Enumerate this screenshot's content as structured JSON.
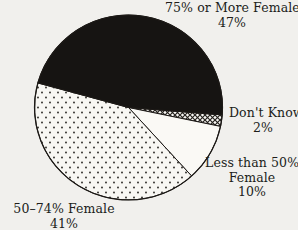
{
  "chart_data": {
    "type": "pie",
    "title": "",
    "unit": "%",
    "total": 100,
    "start_angle_deg": 4.6,
    "direction": "clockwise",
    "legend_position": "outside-labels",
    "slices": [
      {
        "id": "dont-know",
        "label": "Don't Know",
        "pct_label": "2%",
        "value": 2,
        "fill": "crosshatch"
      },
      {
        "id": "less-than-50-female",
        "label": "Less than 50% Female",
        "pct_label": "10%",
        "value": 10,
        "fill": "white"
      },
      {
        "id": "50-74-female",
        "label": "50–74% Female",
        "pct_label": "41%",
        "value": 41,
        "fill": "dots"
      },
      {
        "id": "75-or-more-female",
        "label": "75% or More Female",
        "pct_label": "47%",
        "value": 47,
        "fill": "black"
      }
    ],
    "colors": {
      "black_fill": "#161412",
      "white_fill": "#faf9f5",
      "pattern_ink": "#24211d",
      "pattern_bg": "#f8f7f3",
      "outline": "#1c1916",
      "background": "#f1f0ed",
      "text": "#201d1a"
    }
  },
  "labels": {
    "seventy_five_or_more": {
      "line1": "75% or More Female",
      "line2": "47%"
    },
    "dont_know": {
      "line1": "Don't Know",
      "line2": "2%"
    },
    "less_than_50": {
      "line1": "Less than 50%",
      "line2": "Female",
      "line3": "10%"
    },
    "fifty_to_74": {
      "line1": "50–74% Female",
      "line2": "41%"
    }
  }
}
